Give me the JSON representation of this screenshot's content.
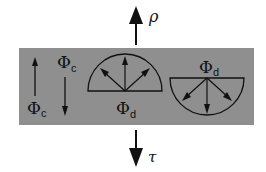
{
  "diagram": {
    "layer_color": "#8f8f8f",
    "reflection_label": "ρ",
    "transmission_label": "τ",
    "collimated_flux_symbol": "Φ",
    "collimated_flux_subscript": "c",
    "diffuse_flux_symbol": "Φ",
    "diffuse_flux_subscript": "d",
    "labels": [
      {
        "id": "phi-c-left",
        "symbol": "Φ",
        "sub": "c"
      },
      {
        "id": "phi-c-right",
        "symbol": "Φ",
        "sub": "c"
      },
      {
        "id": "phi-d-upper",
        "symbol": "Φ",
        "sub": "d"
      },
      {
        "id": "phi-d-lower",
        "symbol": "Φ",
        "sub": "d"
      }
    ]
  }
}
